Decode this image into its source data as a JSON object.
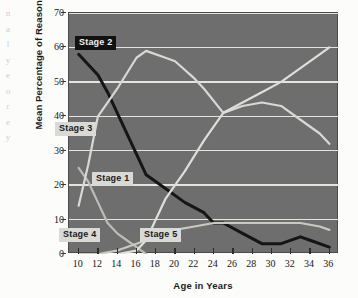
{
  "figure": {
    "y_axis_title": "Mean Percentage of Reasoning",
    "x_axis_title": "Age in Years",
    "edge_bleed_text": "n\na\nl\ny\ne\no\nr\ne\ny"
  },
  "chart_data": {
    "type": "line",
    "title": "",
    "xlabel": "Age in Years",
    "ylabel": "Mean Percentage of Reasoning",
    "xlim": [
      9,
      37
    ],
    "ylim": [
      0,
      70
    ],
    "xticks": [
      10,
      12,
      14,
      16,
      18,
      20,
      22,
      24,
      26,
      28,
      30,
      32,
      34,
      36
    ],
    "yticks": [
      0,
      10,
      20,
      30,
      40,
      50,
      60,
      70
    ],
    "grid": "horizontal",
    "legend": "inline-callouts",
    "series": [
      {
        "name": "Stage 1",
        "color": "#bdbdb8",
        "label_style": "light",
        "x": [
          10,
          11,
          12,
          13,
          14,
          15,
          16,
          17
        ],
        "values": [
          25,
          21,
          15,
          9,
          6,
          4,
          2,
          0
        ]
      },
      {
        "name": "Stage 2",
        "color": "#151515",
        "label_style": "dark",
        "x": [
          10,
          12,
          13,
          14,
          16,
          17,
          19,
          21,
          23,
          24,
          25,
          27,
          29,
          31,
          33,
          34,
          36
        ],
        "values": [
          58,
          52,
          47,
          41,
          29,
          23,
          19,
          15,
          12,
          9,
          9,
          6,
          3,
          3,
          5,
          4,
          2
        ]
      },
      {
        "name": "Stage 3",
        "color": "#d8d8d4",
        "label_style": "light",
        "x": [
          10,
          11,
          12,
          13,
          14,
          16,
          17,
          19,
          20,
          22,
          23,
          25,
          27,
          29,
          31,
          33,
          35,
          36
        ],
        "values": [
          14,
          26,
          40,
          44,
          48,
          57,
          59,
          57,
          56,
          51,
          48,
          41,
          43,
          44,
          43,
          39,
          35,
          32
        ]
      },
      {
        "name": "Stage 4",
        "color": "#c9c9c4",
        "label_style": "light",
        "x": [
          10,
          12,
          14,
          16,
          18,
          20,
          22,
          24,
          25,
          27,
          29,
          31,
          33,
          35,
          36
        ],
        "values": [
          0,
          0,
          1,
          3,
          5,
          7,
          8,
          9,
          9,
          9,
          9,
          9,
          9,
          8,
          7
        ]
      },
      {
        "name": "Stage 5",
        "color": "#dedeDA",
        "label_style": "light",
        "x": [
          14,
          16,
          17,
          18,
          19,
          21,
          23,
          25,
          27,
          29,
          31,
          33,
          35,
          36
        ],
        "values": [
          0,
          1,
          4,
          10,
          16,
          24,
          33,
          41,
          44,
          47,
          50,
          54,
          58,
          60
        ]
      }
    ],
    "callouts": [
      {
        "label": "Stage 2",
        "style": "dark",
        "x_px": 75,
        "y_px": 36
      },
      {
        "label": "Stage 3",
        "style": "light",
        "x_px": 55,
        "y_px": 122
      },
      {
        "label": "Stage 1",
        "style": "light",
        "x_px": 92,
        "y_px": 172
      },
      {
        "label": "Stage 4",
        "style": "light",
        "x_px": 59,
        "y_px": 228
      },
      {
        "label": "Stage 5",
        "style": "light",
        "x_px": 140,
        "y_px": 228
      }
    ]
  }
}
